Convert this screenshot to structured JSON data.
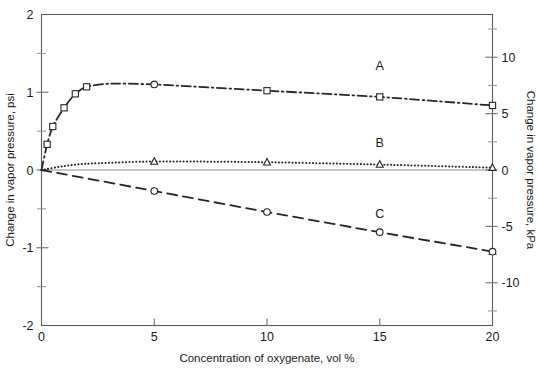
{
  "chart_data": {
    "type": "line",
    "title": "",
    "xlabel": "Concentration of oxygenate, vol %",
    "ylabel": "Change in vapor pressure, psi",
    "y2label": "Change in vapor pressure, kPa",
    "xlim": [
      0,
      20
    ],
    "ylim": [
      -2,
      2
    ],
    "y2lim": [
      -13.79,
      13.79
    ],
    "xticks": [
      0,
      5,
      10,
      15,
      20
    ],
    "xtick_labels": [
      "0",
      "5",
      "10",
      "15",
      "20"
    ],
    "yticks": [
      2,
      1,
      0,
      -1,
      -2
    ],
    "ytick_labels": [
      "2",
      "1",
      "0",
      "-1",
      "-2"
    ],
    "yminor_ticks": [
      1.5,
      0.5,
      -0.5,
      -1.5
    ],
    "y2ticks": [
      10,
      5,
      0,
      -5,
      -10
    ],
    "y2tick_labels": [
      "10",
      "5",
      "0",
      "-5",
      "-10"
    ],
    "y2minor_ticks": [
      12.5,
      7.5,
      2.5,
      -2.5,
      -7.5,
      -12.5
    ],
    "grid": false,
    "legend_position": "inline-annotations",
    "series": [
      {
        "name": "A",
        "label": "A",
        "line_style": "dash-dot",
        "marker": "square",
        "annotation_x": 15,
        "annotation_y": 1.28,
        "x": [
          0,
          0.25,
          0.5,
          1,
          1.5,
          2,
          3,
          5,
          10,
          15,
          20
        ],
        "y": [
          0.0,
          0.33,
          0.56,
          0.8,
          0.98,
          1.07,
          1.11,
          1.1,
          1.02,
          0.94,
          0.83
        ],
        "marker_x": [
          0.25,
          0.5,
          1,
          1.5,
          2,
          5,
          10,
          15,
          20
        ],
        "marker_y": [
          0.33,
          0.56,
          0.8,
          0.98,
          1.07,
          1.1,
          1.02,
          0.94,
          0.83
        ],
        "marker_shapes": [
          "square",
          "square",
          "square",
          "square",
          "square",
          "circle",
          "square",
          "square",
          "square"
        ]
      },
      {
        "name": "B",
        "label": "B",
        "line_style": "dotted",
        "marker": "triangle",
        "annotation_x": 15,
        "annotation_y": 0.29,
        "x": [
          0,
          1,
          2,
          5,
          10,
          15,
          20
        ],
        "y": [
          0.0,
          0.05,
          0.08,
          0.11,
          0.1,
          0.07,
          0.03
        ],
        "marker_x": [
          5,
          10,
          15,
          20
        ],
        "marker_y": [
          0.11,
          0.1,
          0.07,
          0.03
        ],
        "marker_shapes": [
          "triangle",
          "triangle",
          "triangle",
          "triangle"
        ]
      },
      {
        "name": "C",
        "label": "C",
        "line_style": "dashed",
        "marker": "circle",
        "annotation_x": 15,
        "annotation_y": -0.62,
        "x": [
          0,
          5,
          10,
          15,
          20
        ],
        "y": [
          0.0,
          -0.27,
          -0.54,
          -0.8,
          -1.05
        ],
        "marker_x": [
          5,
          10,
          15,
          20
        ],
        "marker_y": [
          -0.27,
          -0.54,
          -0.8,
          -1.05
        ],
        "marker_shapes": [
          "circle",
          "circle",
          "circle",
          "circle"
        ]
      }
    ]
  },
  "axes": {
    "left_title": "Change in vapor pressure, psi",
    "right_title": "Change in vapor pressure, kPa",
    "bottom_title": "Concentration of oxygenate, vol %"
  },
  "colors": {
    "curve": "#23272b",
    "frame": "#555c5e",
    "text": "#1a1a1a",
    "background": "#ffffff"
  }
}
